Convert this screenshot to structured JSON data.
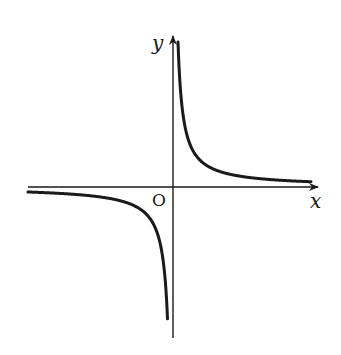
{
  "figure": {
    "function": "y = k/x",
    "k_sign": "positive",
    "labels": {
      "x_axis": "x",
      "y_axis": "y",
      "origin": "O"
    },
    "colors": {
      "background": "#ffffff",
      "stroke": "#1a1a1a"
    }
  }
}
